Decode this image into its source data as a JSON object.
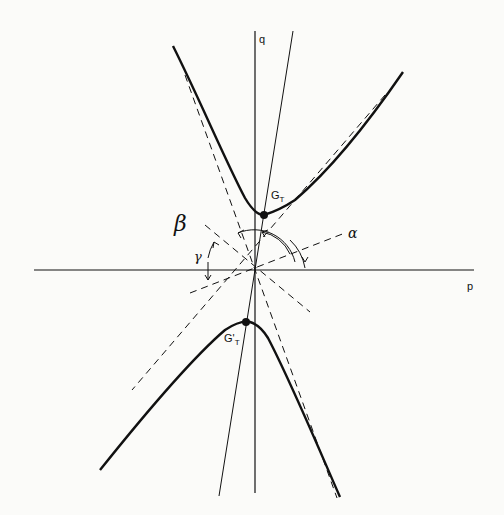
{
  "figure": {
    "axes": {
      "horizontal_label": "p",
      "vertical_label": "q"
    },
    "points": {
      "upper_vertex_label": "G",
      "upper_vertex_sub": "T",
      "lower_vertex_label": "G'",
      "lower_vertex_sub": "T"
    },
    "angles": {
      "alpha": "α",
      "beta": "β",
      "gamma": "γ"
    },
    "colors": {
      "ink": "#111111",
      "paper": "#fbfbf9"
    }
  }
}
